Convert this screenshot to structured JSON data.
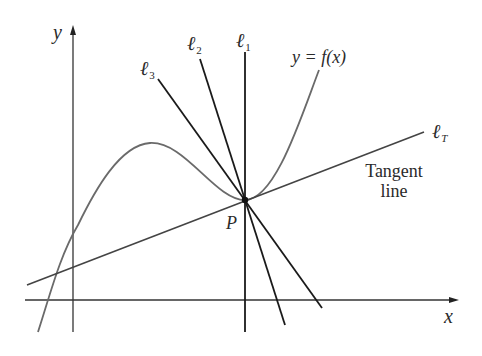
{
  "figure": {
    "axes": {
      "x_label": "x",
      "y_label": "y"
    },
    "curve": {
      "label": "y = f(x)"
    },
    "point": {
      "label": "P"
    },
    "lines": {
      "l1": {
        "symbol": "ℓ",
        "subscript": "1"
      },
      "l2": {
        "symbol": "ℓ",
        "subscript": "2"
      },
      "l3": {
        "symbol": "ℓ",
        "subscript": "3"
      },
      "lT": {
        "symbol": "ℓ",
        "subscript": "T"
      }
    },
    "tangent_label": {
      "line1": "Tangent",
      "line2": "line"
    },
    "colors": {
      "curve": "#6a6a6a",
      "lines": "#1a1a1a",
      "axes": "#333333",
      "text": "#2a2a2a"
    }
  }
}
